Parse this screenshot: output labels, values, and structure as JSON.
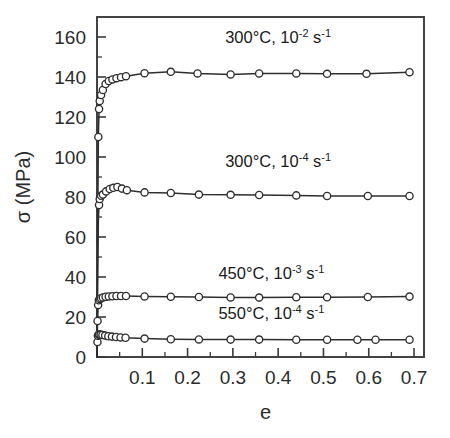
{
  "chart_data": {
    "type": "line",
    "title": "",
    "xlabel": "e",
    "ylabel": "σ  (MPa)",
    "xlim": [
      0,
      0.722
    ],
    "ylim": [
      0,
      170
    ],
    "grid": false,
    "legend_position": "inline-annotations",
    "x_ticks": [
      0.1,
      0.2,
      0.3,
      0.4,
      0.5,
      0.6,
      0.7
    ],
    "x_tick_labels": [
      "0.1",
      "0.2",
      "0.3",
      "0.4",
      "0.5",
      "0.6",
      "0.7"
    ],
    "x_minor_ticks": [
      0.05,
      0.15,
      0.25,
      0.35,
      0.45,
      0.55,
      0.65
    ],
    "y_ticks": [
      0,
      20,
      40,
      60,
      80,
      100,
      120,
      140,
      160
    ],
    "y_tick_labels": [
      "0",
      "20",
      "40",
      "60",
      "80",
      "100",
      "120",
      "140",
      "160"
    ],
    "y_minor_ticks": [
      10,
      30,
      50,
      70,
      90,
      110,
      130,
      150
    ],
    "marker": "open-circle",
    "series": [
      {
        "name": "300°C, 10^-2 s^-1",
        "label_temp": "300",
        "label_degc": "°C, 10",
        "label_exp": "-2",
        "label_unit": " s",
        "label_unit_exp": "-1",
        "annotation_x": 0.4,
        "annotation_y": 157,
        "points": [
          [
            0.0,
            0.0
          ],
          [
            0.0015,
            62
          ],
          [
            0.003,
            110
          ],
          [
            0.0045,
            124
          ],
          [
            0.006,
            128
          ],
          [
            0.009,
            131
          ],
          [
            0.013,
            133.5
          ],
          [
            0.019,
            136.5
          ],
          [
            0.026,
            138
          ],
          [
            0.034,
            138.8
          ],
          [
            0.043,
            139.4
          ],
          [
            0.053,
            139.9
          ],
          [
            0.064,
            140.4
          ],
          [
            0.105,
            141.9
          ],
          [
            0.163,
            142.6
          ],
          [
            0.222,
            141.8
          ],
          [
            0.295,
            141.3
          ],
          [
            0.358,
            141.8
          ],
          [
            0.44,
            141.8
          ],
          [
            0.508,
            141.6
          ],
          [
            0.595,
            141.6
          ],
          [
            0.69,
            142.4
          ]
        ]
      },
      {
        "name": "300°C, 10^-4 s^-1",
        "label_temp": "300",
        "label_degc": "°C, 10",
        "label_exp": "-4",
        "label_unit": " s",
        "label_unit_exp": "-1",
        "annotation_x": 0.4,
        "annotation_y": 95,
        "points": [
          [
            0.0,
            0.0
          ],
          [
            0.0015,
            40
          ],
          [
            0.003,
            68
          ],
          [
            0.0045,
            76
          ],
          [
            0.006,
            79
          ],
          [
            0.009,
            80.6
          ],
          [
            0.013,
            81.2
          ],
          [
            0.02,
            82.8
          ],
          [
            0.028,
            84.0
          ],
          [
            0.036,
            84.6
          ],
          [
            0.045,
            85.0
          ],
          [
            0.055,
            84.2
          ],
          [
            0.066,
            83.4
          ],
          [
            0.105,
            82.3
          ],
          [
            0.163,
            82.0
          ],
          [
            0.225,
            81.2
          ],
          [
            0.295,
            81.1
          ],
          [
            0.358,
            81.0
          ],
          [
            0.44,
            80.8
          ],
          [
            0.508,
            80.5
          ],
          [
            0.598,
            80.5
          ],
          [
            0.69,
            80.5
          ]
        ]
      },
      {
        "name": "450°C, 10^-3 s^-1",
        "label_temp": "450",
        "label_degc": "°C, 10",
        "label_exp": "-3",
        "label_unit": " s",
        "label_unit_exp": "-1",
        "annotation_x": 0.385,
        "annotation_y": 39,
        "points": [
          [
            0.0,
            0.0
          ],
          [
            0.0012,
            18
          ],
          [
            0.0025,
            26
          ],
          [
            0.004,
            28.4
          ],
          [
            0.006,
            29.0
          ],
          [
            0.009,
            29.4
          ],
          [
            0.013,
            29.8
          ],
          [
            0.019,
            30.1
          ],
          [
            0.026,
            30.3
          ],
          [
            0.034,
            30.4
          ],
          [
            0.043,
            30.5
          ],
          [
            0.053,
            30.5
          ],
          [
            0.064,
            30.5
          ],
          [
            0.105,
            30.3
          ],
          [
            0.163,
            30.1
          ],
          [
            0.225,
            30.0
          ],
          [
            0.295,
            29.8
          ],
          [
            0.358,
            29.7
          ],
          [
            0.44,
            29.9
          ],
          [
            0.508,
            29.9
          ],
          [
            0.598,
            30.0
          ],
          [
            0.69,
            30.2
          ]
        ]
      },
      {
        "name": "550°C, 10^-4 s^-1",
        "label_temp": "550",
        "label_degc": "°C, 10",
        "label_exp": "-4",
        "label_unit": " s",
        "label_unit_exp": "-1",
        "annotation_x": 0.385,
        "annotation_y": 19,
        "points": [
          [
            0.0,
            0.0
          ],
          [
            0.001,
            7.5
          ],
          [
            0.002,
            10.6
          ],
          [
            0.0035,
            11.2
          ],
          [
            0.005,
            11.3
          ],
          [
            0.008,
            11.2
          ],
          [
            0.012,
            11.0
          ],
          [
            0.018,
            10.7
          ],
          [
            0.025,
            10.4
          ],
          [
            0.033,
            10.2
          ],
          [
            0.042,
            10.0
          ],
          [
            0.052,
            9.8
          ],
          [
            0.063,
            9.6
          ],
          [
            0.105,
            9.2
          ],
          [
            0.163,
            8.9
          ],
          [
            0.225,
            8.8
          ],
          [
            0.295,
            8.7
          ],
          [
            0.358,
            8.7
          ],
          [
            0.44,
            8.6
          ],
          [
            0.508,
            8.6
          ],
          [
            0.575,
            8.6
          ],
          [
            0.615,
            8.6
          ],
          [
            0.69,
            8.6
          ]
        ]
      }
    ]
  }
}
